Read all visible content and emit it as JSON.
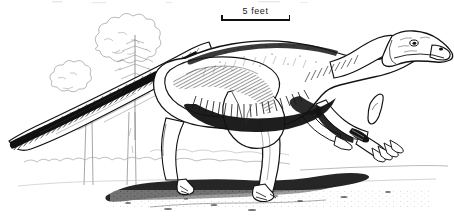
{
  "figure": {
    "medium": "pen-and-ink scientific illustration",
    "palette": {
      "ink": "#111111",
      "paper": "#ffffff",
      "light_ink": "#6f6f6f",
      "faint_ink": "#b8b8b8"
    },
    "dimensions": {
      "width": 454,
      "height": 219
    }
  },
  "scale_bar": {
    "label": "5 feet",
    "value": 5,
    "unit": "feet",
    "length_px": 69,
    "left_px": 221,
    "top_px": 6
  },
  "subject": {
    "name": "ornithopod-dinosaur",
    "common_name": "Iguanodon",
    "facing": "right",
    "posture": "walking, semi-bipedal with forelimbs lowered",
    "features": [
      "long tapering tail held off the ground",
      "deep hatched shading along flank and underside",
      "narrow beaked snout with nostril and eye",
      "three-toed hind feet",
      "forelimb with conical thumb spike"
    ]
  },
  "background": {
    "elements": [
      "leafy tree canopy at upper left",
      "conifer sapling",
      "two bare tree trunks",
      "low scrub line across the horizon",
      "cast shadow pooled beneath the animal"
    ]
  }
}
